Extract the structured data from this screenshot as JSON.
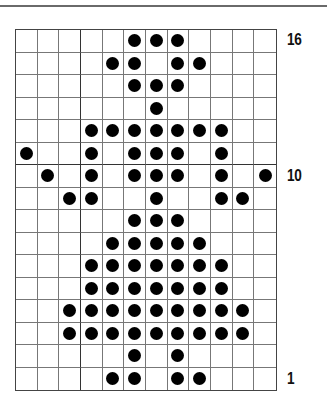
{
  "chart": {
    "columns": 12,
    "rows": 16,
    "row_labels": [
      {
        "row": 16,
        "text": "16"
      },
      {
        "row": 10,
        "text": "10"
      },
      {
        "row": 1,
        "text": "1"
      }
    ],
    "thick_vertical_after_col": [
      2
    ],
    "thick_horizontal_below_row": [
      11
    ],
    "dot_color": "#000000",
    "grid_line_color": "#777777",
    "pattern": {
      "16": [
        5,
        6,
        7
      ],
      "15": [
        4,
        5,
        7,
        8
      ],
      "14": [
        5,
        6,
        7
      ],
      "13": [
        6
      ],
      "12": [
        3,
        4,
        5,
        6,
        7,
        8,
        9
      ],
      "11": [
        0,
        3,
        5,
        6,
        7,
        9
      ],
      "10": [
        1,
        3,
        5,
        6,
        7,
        9,
        11
      ],
      "9": [
        2,
        3,
        6,
        9,
        10
      ],
      "8": [
        5,
        6,
        7
      ],
      "7": [
        4,
        5,
        6,
        7,
        8
      ],
      "6": [
        3,
        4,
        5,
        6,
        7,
        8,
        9
      ],
      "5": [
        3,
        4,
        5,
        6,
        7,
        8,
        9
      ],
      "4": [
        2,
        3,
        4,
        5,
        6,
        7,
        8,
        9,
        10
      ],
      "3": [
        2,
        3,
        4,
        5,
        6,
        7,
        8,
        9,
        10
      ],
      "2": [
        5,
        7
      ],
      "1": [
        4,
        5,
        7,
        8
      ]
    }
  },
  "labels": {
    "row16": "16",
    "row10": "10",
    "row1": "1"
  }
}
